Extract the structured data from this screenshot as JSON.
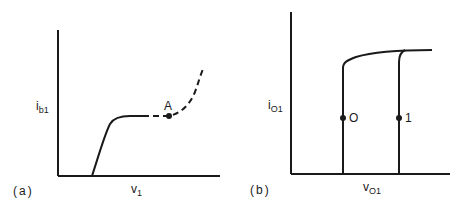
{
  "panels": [
    {
      "id": "a",
      "tag": "(a)",
      "y_axis": {
        "main": "i",
        "sub": "b1"
      },
      "x_axis": {
        "main": "v",
        "sub": "1"
      },
      "points": [
        {
          "label": "A"
        }
      ],
      "curve": "solid rise then plateau, dashed continuation through point A, then dashed rising branch"
    },
    {
      "id": "b",
      "tag": "(b)",
      "y_axis": {
        "main": "i",
        "sub": "O1"
      },
      "x_axis": {
        "main": "v",
        "sub": "O1"
      },
      "points": [
        {
          "label": "O"
        },
        {
          "label": "1"
        }
      ],
      "curve": "two vertical branches joining a common saturated top line"
    }
  ],
  "colors": {
    "ink": "#1a1a1a",
    "background": "#ffffff"
  }
}
